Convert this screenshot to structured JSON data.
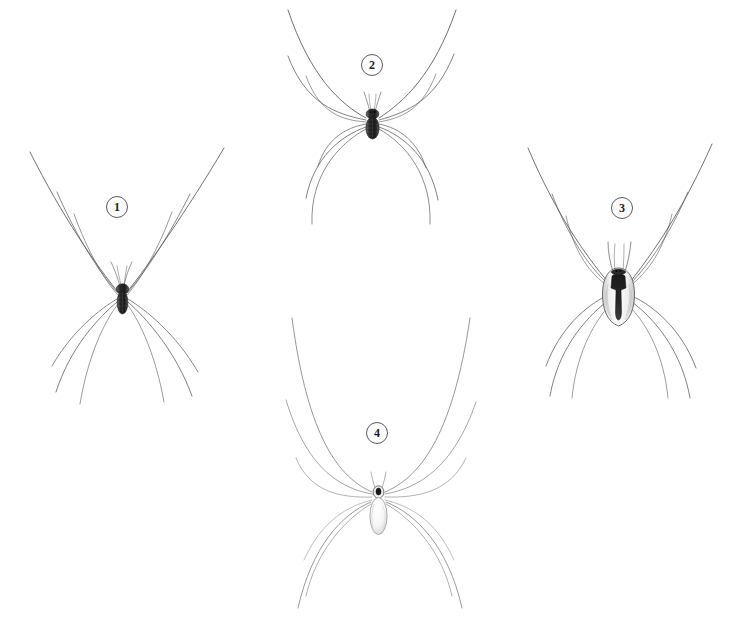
{
  "plate": {
    "background_color": "#ffffff",
    "ink_color": "#4a4a4a",
    "dark_body_color": "#2b2b2b",
    "width": 741,
    "height": 622,
    "caption": ""
  },
  "figures": [
    {
      "number": "1",
      "label_x": 106,
      "label_y": 196,
      "body_x": 122,
      "body_y": 297,
      "body_style": "dark-elongate-abdomen",
      "description": "harvestman with slender dark elongate body and eight very long thin legs spreading wide"
    },
    {
      "number": "2",
      "label_x": 361,
      "label_y": 54,
      "body_x": 372,
      "body_y": 122,
      "body_style": "dark-banded-abdomen",
      "description": "harvestman with short dark banded abdomen and eight extremely long legs reaching top of plate"
    },
    {
      "number": "3",
      "label_x": 611,
      "label_y": 197,
      "body_x": 618,
      "body_y": 292,
      "body_style": "dark-saddle-marking",
      "description": "harvestman with broad pale body bearing a dark anchor-shaped dorsal saddle marking"
    },
    {
      "number": "4",
      "label_x": 366,
      "label_y": 422,
      "body_x": 378,
      "body_y": 497,
      "body_style": "pale-oval-abdomen",
      "description": "cellar spider with small cephalothorax and long pale translucent oval abdomen"
    }
  ]
}
